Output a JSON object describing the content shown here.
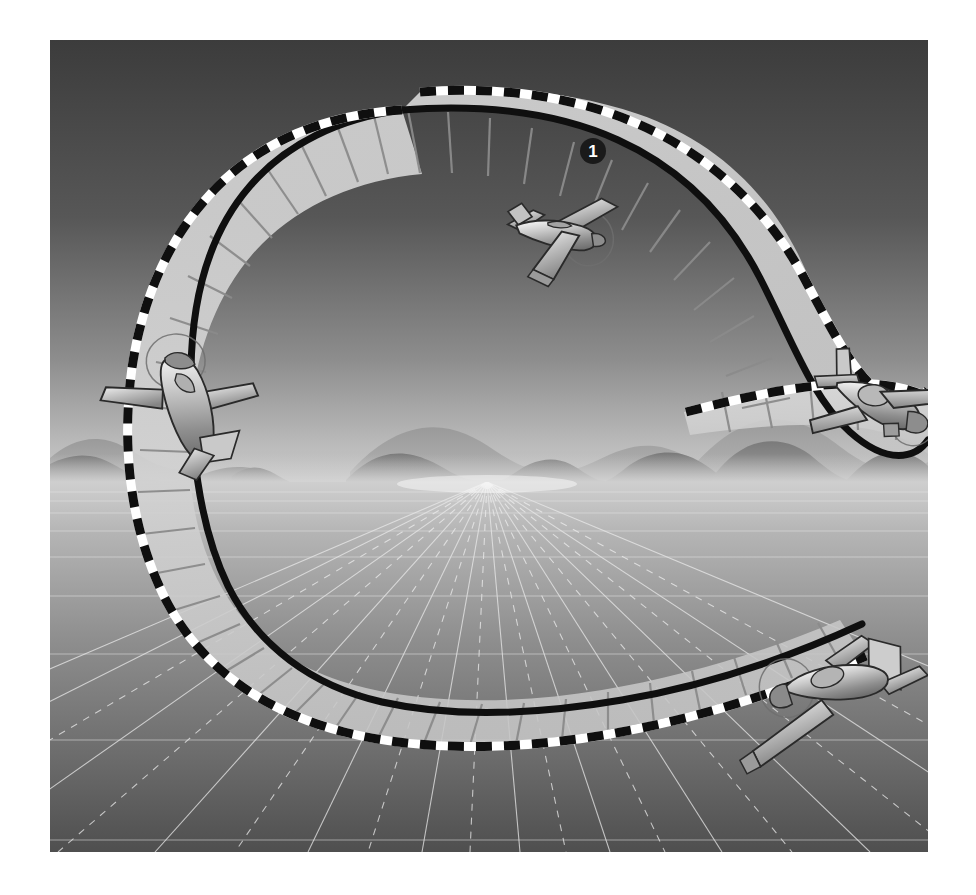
{
  "figure": {
    "frame": {
      "x": 50,
      "y": 40,
      "width": 878,
      "height": 812,
      "page_background": "#ffffff"
    },
    "callouts": [
      {
        "id": "callout-1",
        "label": "1",
        "x": 593,
        "y": 151,
        "radius": 13,
        "fill": "#1a1a1a",
        "text_color": "#ffffff"
      }
    ],
    "scene": {
      "sky": {
        "top_color": "#3f3f3f",
        "bottom_color": "#b9b9b9",
        "horizon_y": 482
      },
      "ground": {
        "near_color": "#4e4e4e",
        "far_color": "#c9c9c9",
        "grid_color": "#e8e8e8",
        "vanishing_point": {
          "x": 487,
          "y": 482
        }
      },
      "mountains": {
        "back_color": "#8e8e8e",
        "front_color": "#7b7b7b",
        "baseline_y": 482
      },
      "haze": {
        "color": "#cfcfcf"
      }
    },
    "path": {
      "name": "flight-path-ribbon",
      "fill": "#d3d3d3",
      "fill_opacity": 0.88,
      "solid_edge_color": "#111111",
      "dashed_edge_colors": [
        "#111111",
        "#ffffff"
      ],
      "rung_color": "#8a8a8a",
      "rung_count": 46,
      "shape": "reverse-S hook (lazy eight / chandelle ribbon)"
    },
    "aircraft": [
      {
        "id": "aircraft-1",
        "position_label": "top-center",
        "x": 500,
        "y": 190,
        "heading": "banking left, nose right",
        "body_color": "#b0b0b0",
        "outline_color": "#2a2a2a"
      },
      {
        "id": "aircraft-2",
        "position_label": "right",
        "x": 852,
        "y": 364,
        "heading": "level, nose toward viewer",
        "body_color": "#b0b0b0",
        "outline_color": "#2a2a2a"
      },
      {
        "id": "aircraft-3",
        "position_label": "left",
        "x": 136,
        "y": 368,
        "heading": "steep bank, nose down",
        "body_color": "#b0b0b0",
        "outline_color": "#2a2a2a"
      },
      {
        "id": "aircraft-4",
        "position_label": "bottom-right",
        "x": 775,
        "y": 672,
        "heading": "banking right, climbing",
        "body_color": "#b0b0b0",
        "outline_color": "#2a2a2a"
      }
    ]
  }
}
